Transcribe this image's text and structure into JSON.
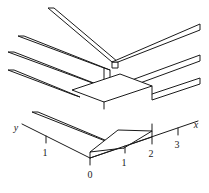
{
  "figure": {
    "kind": "3d-step-surface-line-drawing",
    "caption": "",
    "background_color": "#ffffff",
    "stroke_color": "#1a1a1a"
  },
  "axes": {
    "x": {
      "label": "x",
      "label_pos": {
        "x": 196,
        "y": 128
      },
      "line": {
        "x1": 90,
        "y1": 158,
        "x2": 198,
        "y2": 121
      },
      "ticks": [
        {
          "value": "0",
          "tick": {
            "x1": 90,
            "y1": 158,
            "x2": 90,
            "y2": 165
          },
          "text_pos": {
            "x": 90,
            "y": 178
          }
        },
        {
          "value": "1",
          "tick": {
            "x1": 125,
            "y1": 146,
            "x2": 125,
            "y2": 153
          },
          "text_pos": {
            "x": 124,
            "y": 166
          }
        },
        {
          "value": "2",
          "tick": {
            "x1": 152,
            "y1": 137,
            "x2": 152,
            "y2": 144
          },
          "text_pos": {
            "x": 151,
            "y": 157
          }
        },
        {
          "value": "3",
          "tick": {
            "x1": 178,
            "y1": 128,
            "x2": 178,
            "y2": 135
          },
          "text_pos": {
            "x": 177,
            "y": 148
          }
        }
      ]
    },
    "y": {
      "label": "y",
      "label_pos": {
        "x": 16,
        "y": 131
      },
      "line": {
        "x1": 90,
        "y1": 158,
        "x2": 22,
        "y2": 124
      },
      "ticks": [
        {
          "value": "1",
          "tick": {
            "x1": 46,
            "y1": 136,
            "x2": 46,
            "y2": 143
          },
          "text_pos": {
            "x": 45,
            "y": 156
          }
        }
      ]
    }
  },
  "surface": {
    "description": "staircase / step surface built from three flat slab treads of increasing height, each slab drawn as a long thin ribbon extending toward upper-left, joined by vertical risers",
    "slabs": [
      {
        "name": "slab-lower-front",
        "height_level": 0
      },
      {
        "name": "slab-middle",
        "height_level": 1
      },
      {
        "name": "slab-upper-back",
        "height_level": 2
      }
    ],
    "paths": {
      "bottom_tread_top": "M 90 158 L 152 137 L 152 131 L 90 152 Z",
      "bottom_tread_right_wing": "M 152 137 L 198 121",
      "bottom_ribbon_left": "M 90 152 L 22 124",
      "mid_riser": "M 152 131 L 152 137",
      "mid_tread_top": "M 110 107 L 152 131",
      "upper_riser": "M 110 86 L 110 107",
      "upper_tread_top": "M 110 86 L 148 64"
    }
  }
}
